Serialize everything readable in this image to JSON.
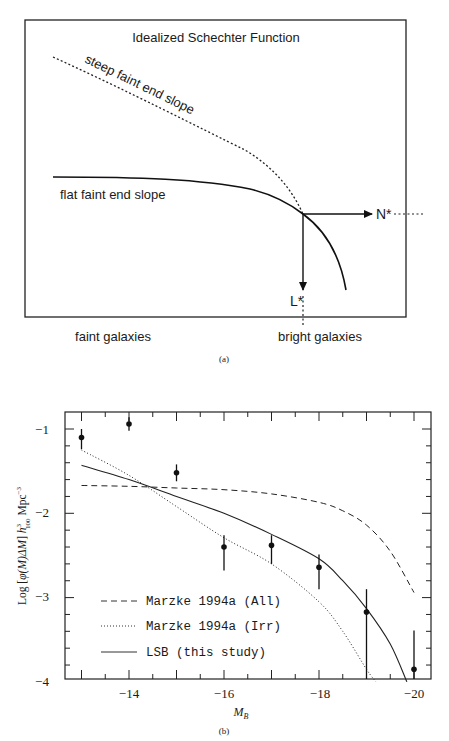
{
  "chart_data": [
    {
      "panel": "a",
      "type": "line",
      "title": "Idealized Schechter Function",
      "caption": "(a)",
      "xlabel_left": "faint galaxies",
      "xlabel_right": "bright galaxies",
      "annotations": {
        "steep": "steep faint end slope",
        "flat": "flat faint end slope",
        "n_star": "N*",
        "l_star": "L*"
      },
      "series": [
        {
          "name": "steep faint end slope",
          "style": "dotted"
        },
        {
          "name": "flat faint end slope",
          "style": "solid"
        }
      ],
      "grid": false
    },
    {
      "panel": "b",
      "type": "scatter",
      "caption": "(b)",
      "title": "",
      "xlabel": "M_B",
      "xlabel_main": "M",
      "xlabel_sub": "B",
      "ylabel": "Log [φ(M)ΔM] h³₁₀₀ Mpc⁻³",
      "ylabel_parts": {
        "pre": "Log [",
        "phi": "φ(M)ΔM",
        "post": "] ",
        "h": "h",
        "sup": "3",
        "sub": "100",
        "unit": " Mpc",
        "unit_sup": "−3"
      },
      "xlim": [
        -12.65,
        -20.35
      ],
      "ylim": [
        -4,
        -0.8
      ],
      "xticks": [
        -14,
        -16,
        -18,
        -20
      ],
      "xtick_labels": [
        "−14",
        "−16",
        "−18",
        "−20"
      ],
      "yticks": [
        -1,
        -2,
        -3,
        -4
      ],
      "ytick_labels": [
        "−1",
        "−2",
        "−3",
        "−4"
      ],
      "grid": false,
      "legend_position": "lower left",
      "points": {
        "name": "LSB data",
        "x": [
          -13,
          -14,
          -15,
          -16,
          -17,
          -18,
          -19,
          -20
        ],
        "y": [
          -1.1,
          -0.94,
          -1.52,
          -2.4,
          -2.38,
          -2.64,
          -3.17,
          -3.85
        ],
        "err_low": [
          -1.24,
          -1.02,
          -1.62,
          -2.68,
          -2.6,
          -2.9,
          -4.0,
          -4.0
        ],
        "err_high": [
          -1.0,
          -0.86,
          -1.42,
          -2.26,
          -2.26,
          -2.49,
          -2.9,
          -3.39
        ]
      },
      "series": [
        {
          "name": "Marzke 1994a (All)",
          "style": "dashed",
          "x": [
            -13,
            -14,
            -15,
            -16,
            -17,
            -18,
            -18.5,
            -19,
            -19.5,
            -20
          ],
          "y": [
            -1.67,
            -1.68,
            -1.7,
            -1.72,
            -1.77,
            -1.87,
            -1.97,
            -2.14,
            -2.45,
            -2.94
          ]
        },
        {
          "name": "Marzke 1994a (Irr)",
          "style": "dotted",
          "x": [
            -13,
            -14,
            -15,
            -16,
            -17,
            -18,
            -18.5,
            -19,
            -19.2
          ],
          "y": [
            -1.25,
            -1.55,
            -1.92,
            -2.29,
            -2.6,
            -3.05,
            -3.4,
            -3.85,
            -4.0
          ]
        },
        {
          "name": "LSB (this study)",
          "style": "solid",
          "x": [
            -13,
            -14,
            -15,
            -16,
            -17,
            -18,
            -18.5,
            -19,
            -19.5,
            -19.85
          ],
          "y": [
            -1.43,
            -1.6,
            -1.8,
            -2.0,
            -2.25,
            -2.54,
            -2.8,
            -3.13,
            -3.55,
            -4.0
          ]
        }
      ],
      "legend": [
        "Marzke 1994a (All)",
        "Marzke 1994a (Irr)",
        "LSB (this study)"
      ]
    }
  ]
}
